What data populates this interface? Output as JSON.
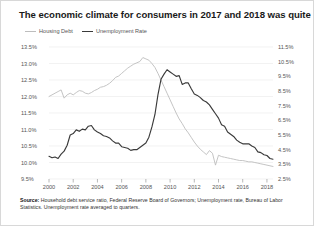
{
  "figure": {
    "title": "The economic climate for consumers in 2017 and 2018 was quite good",
    "source_prefix": "Source:",
    "source_text": " Household debt service ratio, Federal Reserve Board of Governors; Unemployment rate, Bureau of Labor Statistics. Unemployment rate averaged to quarters.",
    "background_color": "#ffffff",
    "border_color": "#d8d8d8"
  },
  "chart_data": {
    "type": "line",
    "title": "The economic climate for consumers in 2017 and 2018 was quite good",
    "xlabel": "",
    "ylabel": "",
    "grid": true,
    "legend_position": "top-left",
    "x": [
      2000,
      2000.25,
      2000.5,
      2000.75,
      2001,
      2001.25,
      2001.5,
      2001.75,
      2002,
      2002.25,
      2002.5,
      2002.75,
      2003,
      2003.25,
      2003.5,
      2003.75,
      2004,
      2004.25,
      2004.5,
      2004.75,
      2005,
      2005.25,
      2005.5,
      2005.75,
      2006,
      2006.25,
      2006.5,
      2006.75,
      2007,
      2007.25,
      2007.5,
      2007.75,
      2008,
      2008.25,
      2008.5,
      2008.75,
      2009,
      2009.25,
      2009.5,
      2009.75,
      2010,
      2010.25,
      2010.5,
      2010.75,
      2011,
      2011.25,
      2011.5,
      2011.75,
      2012,
      2012.25,
      2012.5,
      2012.75,
      2013,
      2013.25,
      2013.5,
      2013.75,
      2014,
      2014.25,
      2014.5,
      2014.75,
      2015,
      2015.25,
      2015.5,
      2015.75,
      2016,
      2016.25,
      2016.5,
      2016.75,
      2017,
      2017.25,
      2017.5,
      2017.75,
      2018,
      2018.25,
      2018.5
    ],
    "xtick_labels": [
      "2000",
      "2002",
      "2004",
      "2006",
      "2008",
      "2010",
      "2012",
      "2014",
      "2016",
      "2018"
    ],
    "xtick_values": [
      2000,
      2002,
      2004,
      2006,
      2008,
      2010,
      2012,
      2014,
      2016,
      2018
    ],
    "xlim": [
      2000,
      2018.5
    ],
    "axes": [
      {
        "id": "left",
        "name": "Housing Debt",
        "unit": "%",
        "tick_labels": [
          "13.5%",
          "13.0%",
          "12.5%",
          "12.0%",
          "11.5%",
          "11.0%",
          "10.5%",
          "10.0%",
          "9.5%"
        ],
        "tick_values": [
          13.5,
          13.0,
          12.5,
          12.0,
          11.5,
          11.0,
          10.5,
          10.0,
          9.5
        ],
        "ylim": [
          9.5,
          13.5
        ]
      },
      {
        "id": "right",
        "name": "Unemployment Rate",
        "unit": "%",
        "tick_labels": [
          "11.5%",
          "10.5%",
          "9.5%",
          "8.5%",
          "7.5%",
          "6.5%",
          "5.5%",
          "4.5%",
          "3.5%",
          "2.5%"
        ],
        "tick_values": [
          11.5,
          10.5,
          9.5,
          8.5,
          7.5,
          6.5,
          5.5,
          4.5,
          3.5,
          2.5
        ],
        "ylim": [
          2.5,
          11.5
        ]
      }
    ],
    "series": [
      {
        "name": "Housing Debt",
        "axis": "left",
        "color": "#bdbdbd",
        "values": [
          12.0,
          12.05,
          12.1,
          12.15,
          12.2,
          11.95,
          12.05,
          12.1,
          12.05,
          12.12,
          12.18,
          12.16,
          12.1,
          12.08,
          12.12,
          12.18,
          12.22,
          12.28,
          12.3,
          12.34,
          12.4,
          12.48,
          12.58,
          12.62,
          12.7,
          12.78,
          12.86,
          12.92,
          12.98,
          13.02,
          13.06,
          13.18,
          13.14,
          13.1,
          13.0,
          12.88,
          12.7,
          12.5,
          12.3,
          12.1,
          11.9,
          11.7,
          11.5,
          11.32,
          11.18,
          11.02,
          10.9,
          10.76,
          10.62,
          10.5,
          10.4,
          10.32,
          10.24,
          10.36,
          10.28,
          9.92,
          10.22,
          10.18,
          10.16,
          10.14,
          10.12,
          10.1,
          10.08,
          10.06,
          10.06,
          10.04,
          10.02,
          10.02,
          10.0,
          9.98,
          9.96,
          9.94,
          9.92,
          9.9,
          9.88
        ]
      },
      {
        "name": "Unemployment Rate",
        "axis": "right",
        "color": "#3a3a3a",
        "values": [
          4.05,
          3.95,
          4.0,
          3.9,
          4.2,
          4.4,
          4.8,
          5.5,
          5.6,
          5.85,
          5.75,
          5.9,
          5.85,
          6.1,
          6.15,
          5.85,
          5.7,
          5.6,
          5.45,
          5.4,
          5.3,
          5.1,
          4.95,
          4.95,
          4.7,
          4.65,
          4.6,
          4.45,
          4.5,
          4.5,
          4.65,
          4.8,
          4.95,
          5.35,
          6.05,
          6.9,
          8.25,
          9.3,
          9.65,
          9.95,
          9.8,
          9.65,
          9.5,
          9.55,
          8.95,
          9.05,
          9.05,
          8.65,
          8.3,
          8.2,
          8.05,
          7.85,
          7.75,
          7.55,
          7.25,
          6.95,
          6.65,
          6.2,
          6.1,
          5.7,
          5.55,
          5.4,
          5.15,
          5.0,
          4.9,
          4.9,
          4.9,
          4.75,
          4.65,
          4.35,
          4.3,
          4.15,
          4.1,
          3.9,
          3.85
        ]
      }
    ]
  }
}
